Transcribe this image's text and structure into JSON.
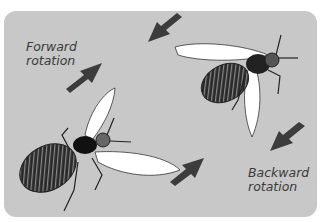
{
  "labels": {
    "forward_line1": "Forward",
    "forward_line2": "rotation",
    "backward_line1": "Backward",
    "backward_line2": "rotation"
  },
  "colors": {
    "background": "#c8c8c8",
    "arrow": "#3c3c3c",
    "wing": "#ffffff",
    "body": "#1e1e1e"
  }
}
